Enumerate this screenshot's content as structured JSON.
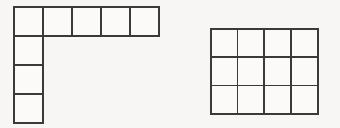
{
  "page": {
    "background_color": "#f7f6f4",
    "width": 340,
    "height": 128
  },
  "style": {
    "line_color": "#3a3a3a",
    "cell_fill": "#fbfaf9",
    "line_width": 1.7,
    "cell_size": 29
  },
  "figures": [
    {
      "id": "l-shape",
      "name": "L-shaped polyomino",
      "description": "Horizontal row of 5 unit squares with a vertical column of 3 additional unit squares descending from the leftmost square",
      "total_cells": 8,
      "bounds": {
        "x": 13,
        "y": 6,
        "width": 147,
        "height": 116
      },
      "cell_size": 29,
      "cells": [
        {
          "col": 0,
          "row": 0
        },
        {
          "col": 1,
          "row": 0
        },
        {
          "col": 2,
          "row": 0
        },
        {
          "col": 3,
          "row": 0
        },
        {
          "col": 4,
          "row": 0
        },
        {
          "col": 0,
          "row": 1
        },
        {
          "col": 0,
          "row": 2
        },
        {
          "col": 0,
          "row": 3
        }
      ],
      "row_counts": [
        5,
        1,
        1,
        1
      ],
      "column_counts": [
        4,
        1,
        1,
        1,
        1
      ]
    },
    {
      "id": "rectangle-grid",
      "name": "4 by 3 rectangular grid",
      "description": "Rectangle subdivided into 4 columns and 3 rows of unit squares",
      "total_cells": 12,
      "bounds": {
        "x": 210,
        "y": 28,
        "width": 107,
        "height": 85
      },
      "columns": 4,
      "rows": 3,
      "cell_width": 26.75,
      "cell_height": 28.33
    }
  ],
  "labels": {
    "figure_one": "",
    "figure_two": ""
  }
}
